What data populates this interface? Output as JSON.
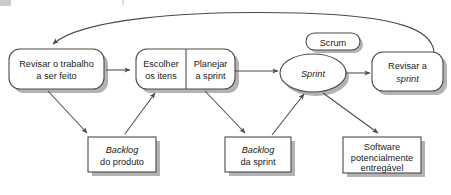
{
  "diagram": {
    "language": "pt-BR",
    "colors": {
      "stroke": "#4a4a4a",
      "shadow": "#b0b0b0",
      "text": "#1b1b1b",
      "background": "#ffffff"
    },
    "nodes": [
      {
        "id": "revisar-trabalho",
        "shape": "rounded-rect",
        "lines": [
          {
            "text": "Revisar o trabalho",
            "italic": false
          },
          {
            "text": "a ser feito",
            "italic": false
          }
        ]
      },
      {
        "id": "escolher-itens",
        "shape": "rounded-rect-split-left",
        "lines": [
          {
            "text": "Escolher",
            "italic": false
          },
          {
            "text": "os itens",
            "italic": false
          }
        ]
      },
      {
        "id": "planejar-sprint",
        "shape": "rounded-rect-split-right",
        "lines": [
          {
            "text": "Planejar",
            "italic": false
          },
          {
            "text": "a ",
            "italic": false,
            "tail": "sprint",
            "tail_italic": true
          }
        ]
      },
      {
        "id": "sprint",
        "shape": "ellipse",
        "lines": [
          {
            "text": "Sprint",
            "italic": true
          }
        ]
      },
      {
        "id": "scrum",
        "shape": "pill",
        "lines": [
          {
            "text": "Scrum",
            "italic": false
          }
        ]
      },
      {
        "id": "revisar-sprint",
        "shape": "rounded-rect",
        "lines": [
          {
            "text": "Revisar a",
            "italic": false
          },
          {
            "text": "sprint",
            "italic": true
          }
        ]
      },
      {
        "id": "backlog-produto",
        "shape": "rect",
        "lines": [
          {
            "text": "Backlog",
            "italic": true
          },
          {
            "text": "do produto",
            "italic": false
          }
        ]
      },
      {
        "id": "backlog-sprint",
        "shape": "rect",
        "lines": [
          {
            "text": "Backlog",
            "italic": true
          },
          {
            "text": "da ",
            "italic": false,
            "tail": "sprint",
            "tail_italic": true
          }
        ]
      },
      {
        "id": "software-entregavel",
        "shape": "rect",
        "lines": [
          {
            "text": "Software",
            "italic": false
          },
          {
            "text": "potencialmente",
            "italic": false
          },
          {
            "text": "entregável",
            "italic": false
          }
        ]
      }
    ],
    "labels": {
      "revisar_trabalho_l1": "Revisar o trabalho",
      "revisar_trabalho_l2": "a ser feito",
      "escolher_l1": "Escolher",
      "escolher_l2": "os itens",
      "planejar_l1": "Planejar",
      "planejar_l2_pre": "a ",
      "planejar_l2_em": "sprint",
      "sprint": "Sprint",
      "scrum": "Scrum",
      "revisar_sprint_l1": "Revisar a",
      "revisar_sprint_l2": "sprint",
      "backlog_produto_l1": "Backlog",
      "backlog_produto_l2": "do produto",
      "backlog_sprint_l1": "Backlog",
      "backlog_sprint_l2_pre": "da ",
      "backlog_sprint_l2_em": "sprint",
      "software_l1": "Software",
      "software_l2": "potencialmente",
      "software_l3": "entregável"
    },
    "edges": [
      {
        "id": "revisar-trabalho-to-escolher",
        "from": "revisar-trabalho",
        "to": "escolher-itens",
        "style": "straight-right"
      },
      {
        "id": "revisar-trabalho-to-backlog-produto",
        "from": "revisar-trabalho",
        "to": "backlog-produto",
        "style": "diagonal-down-right"
      },
      {
        "id": "backlog-produto-to-escolher",
        "from": "backlog-produto",
        "to": "escolher-itens",
        "style": "diagonal-up-right"
      },
      {
        "id": "planejar-to-backlog-sprint",
        "from": "planejar-sprint",
        "to": "backlog-sprint",
        "style": "diagonal-down-right"
      },
      {
        "id": "planejar-to-sprint",
        "from": "planejar-sprint",
        "to": "sprint",
        "style": "straight-right"
      },
      {
        "id": "backlog-sprint-to-sprint",
        "from": "backlog-sprint",
        "to": "sprint",
        "style": "diagonal-up-right"
      },
      {
        "id": "sprint-to-software",
        "from": "sprint",
        "to": "software-entregavel",
        "style": "diagonal-down-right"
      },
      {
        "id": "sprint-to-revisar-sprint",
        "from": "sprint",
        "to": "revisar-sprint",
        "style": "straight-right"
      },
      {
        "id": "revisar-sprint-to-revisar-trabalho",
        "from": "revisar-sprint",
        "to": "revisar-trabalho",
        "style": "curved-feedback-top"
      }
    ]
  }
}
